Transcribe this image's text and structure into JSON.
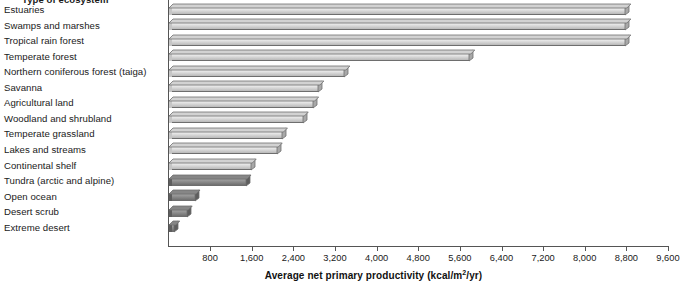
{
  "chart_data": {
    "type": "bar",
    "orientation": "horizontal",
    "title": "Type of ecosystem",
    "xlabel": "Average net primary productivity (kcal/m²/yr)",
    "ylabel": "Type of ecosystem",
    "xlim": [
      0,
      9600
    ],
    "grid": false,
    "legend": null,
    "xticks": [
      800,
      1600,
      2400,
      3200,
      4000,
      4800,
      5600,
      6400,
      7200,
      8000,
      8800,
      9600
    ],
    "xtick_labels": [
      "800",
      "1,600",
      "2,400",
      "3,200",
      "4,000",
      "4,800",
      "5,600",
      "6,400",
      "7,200",
      "8,000",
      "8,800",
      "9,600"
    ],
    "categories": [
      "Estuaries",
      "Swamps and marshes",
      "Tropical rain forest",
      "Temperate forest",
      "Northern coniferous forest (taiga)",
      "Savanna",
      "Agricultural land",
      "Woodland and shrubland",
      "Temperate grassland",
      "Lakes and streams",
      "Continental shelf",
      "Tundra (arctic and alpine)",
      "Open ocean",
      "Desert scrub",
      "Extreme desert"
    ],
    "values": [
      8800,
      8800,
      8800,
      5800,
      3400,
      2900,
      2800,
      2600,
      2200,
      2100,
      1600,
      1400,
      500,
      350,
      100
    ]
  },
  "bars": [
    {
      "label": "Estuaries",
      "value": 8800,
      "shade": "light"
    },
    {
      "label": "Swamps and marshes",
      "value": 8800,
      "shade": "light"
    },
    {
      "label": "Tropical rain forest",
      "value": 8800,
      "shade": "light"
    },
    {
      "label": "Temperate forest",
      "value": 5800,
      "shade": "light"
    },
    {
      "label": "Northern coniferous forest (taiga)",
      "value": 3400,
      "shade": "light"
    },
    {
      "label": "Savanna",
      "value": 2900,
      "shade": "light"
    },
    {
      "label": "Agricultural land",
      "value": 2800,
      "shade": "light"
    },
    {
      "label": "Woodland and shrubland",
      "value": 2600,
      "shade": "light"
    },
    {
      "label": "Temperate grassland",
      "value": 2200,
      "shade": "light"
    },
    {
      "label": "Lakes and streams",
      "value": 2100,
      "shade": "light"
    },
    {
      "label": "Continental shelf",
      "value": 1600,
      "shade": "light"
    },
    {
      "label": "Tundra (arctic and alpine)",
      "value": 1500,
      "shade": "dark"
    },
    {
      "label": "Open ocean",
      "value": 520,
      "shade": "dark"
    },
    {
      "label": "Desert scrub",
      "value": 370,
      "shade": "dark"
    },
    {
      "label": "Extreme desert",
      "value": 130,
      "shade": "dark"
    }
  ],
  "colors": {
    "bar_light_top": "#e9e9e9",
    "bar_light_bottom": "#b9b9b9",
    "bar_dark_top": "#9b9b9b",
    "bar_dark_bottom": "#6f6f6f",
    "bar_outline": "#6e6e6e",
    "axis": "#555555",
    "text": "#1a1a1a",
    "background": "#ffffff"
  }
}
